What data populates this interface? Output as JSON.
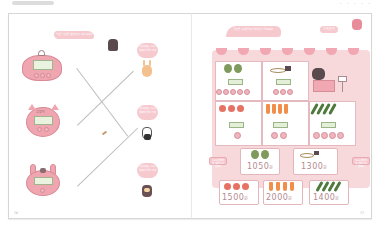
{
  "header": {
    "left_tab": "",
    "right_text": "· · · · ·"
  },
  "left_page": {
    "instruction_bubble": "알맞은 지갑을 찾아 선으로 이어 보세요",
    "purses": [
      {
        "id": "purse-1",
        "style": "round-pink",
        "panel": "bills"
      },
      {
        "id": "purse-2",
        "style": "cat-face",
        "label": "고양이"
      },
      {
        "id": "purse-3",
        "style": "bunny-face"
      }
    ],
    "characters": [
      {
        "id": "char-1",
        "name": "rabbit",
        "bubble": "내 지갑에는 1000원짜리가 들어 있어"
      },
      {
        "id": "char-2",
        "name": "cat",
        "bubble": "내 지갑에는 1000원짜리가 들어 있어"
      },
      {
        "id": "char-3",
        "name": "raccoon",
        "bubble": "내 지갑에는 1000원짜리가 들어 있어"
      }
    ],
    "page_number": "76"
  },
  "right_page": {
    "instruction_bubble": "물건을 사려면 얼마가 필요한지 알아보세요",
    "title_badge": "가게 놀이",
    "store_items_row1": [
      {
        "item": "cabbage",
        "count": 2
      },
      {
        "item": "fish",
        "count": 1
      },
      {
        "item": "shopkeeper",
        "count": 1
      }
    ],
    "store_items_row2": [
      {
        "item": "tomato",
        "count": 3
      },
      {
        "item": "carrot",
        "count": 4
      },
      {
        "item": "cucumber",
        "count": 4
      }
    ],
    "side_tags": [
      {
        "position": "left",
        "text": "1000원짜리 몇 개와 100원짜리"
      },
      {
        "position": "right",
        "text": "1000원짜리 몇 개와 100원짜리"
      }
    ],
    "prices": [
      {
        "item": "cabbage",
        "value": "1050",
        "unit": "원"
      },
      {
        "item": "fish",
        "value": "1300",
        "unit": "원"
      },
      {
        "item": "tomato",
        "value": "1500",
        "unit": "원"
      },
      {
        "item": "carrot",
        "value": "2000",
        "unit": "원"
      },
      {
        "item": "cucumber",
        "value": "1400",
        "unit": "원"
      }
    ],
    "page_number": "77"
  },
  "colors": {
    "pink": "#f0a6b0",
    "light_pink": "#f7d9dc",
    "green_panel": "#e3efd6",
    "price_text": "#b48a90",
    "line": "#bbbbbb"
  }
}
